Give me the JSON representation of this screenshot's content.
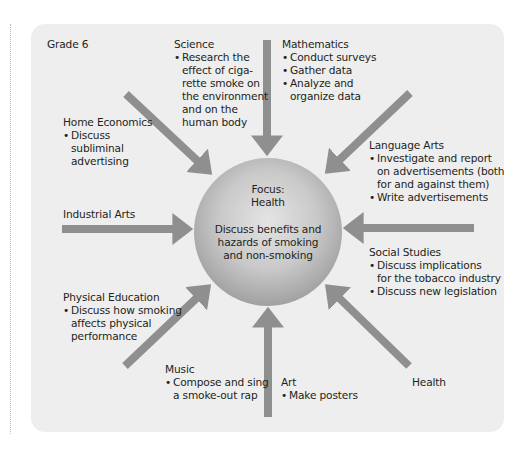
{
  "grade_label": "Grade 6",
  "colors": {
    "panel": "#eeeeee",
    "arrow": "#8f8f8f",
    "circle_center": "#e0e0e0",
    "circle_edge": "#9a9a9a",
    "text": "#231f20"
  },
  "focus": {
    "label": "Focus:\nHealth",
    "description": "Discuss benefits and\nhazards of smoking\nand non-smoking"
  },
  "subjects": [
    {
      "id": "science",
      "title": "Science",
      "bullets": [
        "Research the\neffect of ciga-\nrette smoke on\nthe environment\nand on the\nhuman body"
      ]
    },
    {
      "id": "mathematics",
      "title": "Mathematics",
      "bullets": [
        "Conduct surveys",
        "Gather data",
        "Analyze and\norganize data"
      ]
    },
    {
      "id": "home-economics",
      "title": "Home Economics",
      "bullets": [
        "Discuss\nsubliminal\nadvertising"
      ]
    },
    {
      "id": "language-arts",
      "title": "Language Arts",
      "bullets": [
        "Investigate and report\non advertisements (both\nfor and against them)",
        "Write advertisements"
      ]
    },
    {
      "id": "industrial-arts",
      "title": "Industrial Arts",
      "bullets": []
    },
    {
      "id": "social-studies",
      "title": "Social Studies",
      "bullets": [
        "Discuss implications\nfor the tobacco industry",
        "Discuss new legislation"
      ]
    },
    {
      "id": "physical-education",
      "title": "Physical Education",
      "bullets": [
        "Discuss how smoking\naffects physical\nperformance"
      ]
    },
    {
      "id": "music",
      "title": "Music",
      "bullets": [
        "Compose and sing\na smoke-out rap"
      ]
    },
    {
      "id": "art",
      "title": "Art",
      "bullets": [
        "Make posters"
      ]
    },
    {
      "id": "health",
      "title": "Health",
      "bullets": []
    }
  ]
}
